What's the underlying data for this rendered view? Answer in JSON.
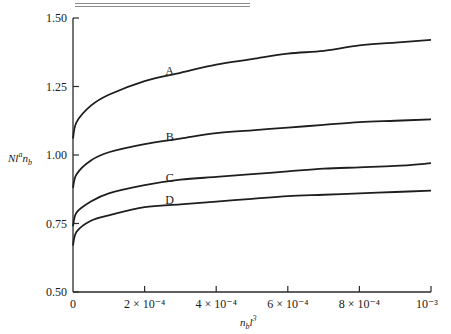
{
  "chart_data": {
    "type": "line",
    "title": "",
    "xlabel": "n_b l^3",
    "ylabel": "N l^a n_b",
    "xlim": [
      0,
      0.001
    ],
    "ylim": [
      0.5,
      1.5
    ],
    "grid": false,
    "legend": "inline labels on curves",
    "x_ticks": [
      0,
      0.0002,
      0.0004,
      0.0006,
      0.0008,
      0.001
    ],
    "x_tick_labels": [
      "0",
      "2 × 10⁻⁴",
      "4 × 10⁻⁴",
      "6 × 10⁻⁴",
      "8 × 10⁻⁴",
      "10⁻³"
    ],
    "y_ticks": [
      0.5,
      0.75,
      1.0,
      1.25,
      1.5
    ],
    "y_tick_labels": [
      "0.50",
      "0.75",
      "1.00",
      "1.25",
      "1.50"
    ],
    "x": [
      0,
      1e-05,
      5e-05,
      0.0001,
      0.0002,
      0.0003,
      0.0004,
      0.0005,
      0.0006,
      0.0007,
      0.0008,
      0.0009,
      0.001
    ],
    "series": [
      {
        "name": "A",
        "values": [
          1.06,
          1.12,
          1.18,
          1.22,
          1.27,
          1.3,
          1.33,
          1.35,
          1.37,
          1.38,
          1.4,
          1.41,
          1.42
        ]
      },
      {
        "name": "B",
        "values": [
          0.88,
          0.93,
          0.98,
          1.01,
          1.04,
          1.06,
          1.08,
          1.09,
          1.1,
          1.11,
          1.12,
          1.125,
          1.13
        ]
      },
      {
        "name": "C",
        "values": [
          0.74,
          0.79,
          0.83,
          0.86,
          0.89,
          0.91,
          0.92,
          0.93,
          0.94,
          0.95,
          0.955,
          0.96,
          0.97
        ]
      },
      {
        "name": "D",
        "values": [
          0.67,
          0.72,
          0.76,
          0.78,
          0.81,
          0.82,
          0.83,
          0.84,
          0.85,
          0.855,
          0.86,
          0.865,
          0.87
        ]
      }
    ],
    "curve_label_positions": [
      {
        "name": "A",
        "x": 0.00027,
        "y": 1.305
      },
      {
        "name": "B",
        "x": 0.00027,
        "y": 1.065
      },
      {
        "name": "C",
        "x": 0.00027,
        "y": 0.915
      },
      {
        "name": "D",
        "x": 0.00027,
        "y": 0.835
      }
    ]
  },
  "axes": {
    "y_title_main": "Nl",
    "y_title_sup": "a",
    "y_title_rest": "n",
    "y_title_sub": "b",
    "x_title_main": "n",
    "x_title_sub": "b",
    "x_title_rest": "l",
    "x_title_sup": "3"
  }
}
